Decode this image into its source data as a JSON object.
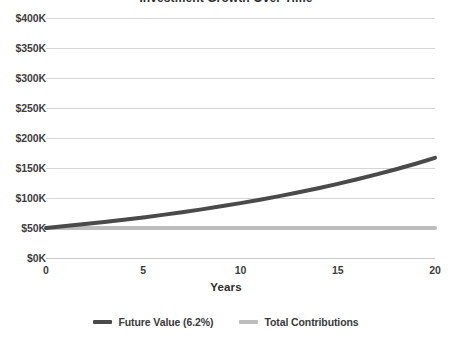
{
  "chart_title_fragment": "Investment Growth Over Time",
  "axis": {
    "x_title": "Years",
    "y_ticks": [
      "$0K",
      "$50K",
      "$100K",
      "$150K",
      "$200K",
      "$250K",
      "$300K",
      "$350K",
      "$400K"
    ],
    "x_ticks": [
      "0",
      "5",
      "10",
      "15",
      "20"
    ]
  },
  "legend": {
    "items": [
      {
        "label": "Future Value (6.2%)",
        "color": "#4a4a4a"
      },
      {
        "label": "Total Contributions",
        "color": "#bdbdbd"
      }
    ]
  },
  "colors": {
    "future_value": "#4a4a4a",
    "total_contributions": "#bdbdbd",
    "gridline": "#d5d5d5",
    "text": "#3d3d3d",
    "background": "#ffffff"
  },
  "chart_data": {
    "type": "line",
    "title": "Investment Growth Over Time",
    "xlabel": "Years",
    "ylabel": "",
    "xlim": [
      0,
      20
    ],
    "ylim": [
      0,
      400000
    ],
    "grid": true,
    "legend_position": "bottom",
    "x": [
      0,
      1,
      2,
      3,
      4,
      5,
      6,
      7,
      8,
      9,
      10,
      11,
      12,
      13,
      14,
      15,
      16,
      17,
      18,
      19,
      20
    ],
    "y_tick_values": [
      0,
      50000,
      100000,
      150000,
      200000,
      250000,
      300000,
      350000,
      400000
    ],
    "x_tick_values": [
      0,
      5,
      10,
      15,
      20
    ],
    "series": [
      {
        "name": "Future Value (6.2%)",
        "color": "#4a4a4a",
        "values": [
          50000,
          53100,
          56392,
          59888,
          63601,
          67544,
          71732,
          76179,
          80902,
          85918,
          91245,
          96902,
          102910,
          109290,
          116066,
          123262,
          130904,
          139020,
          147640,
          156794,
          166515
        ]
      },
      {
        "name": "Total Contributions",
        "color": "#bdbdbd",
        "values": [
          50000,
          50000,
          50000,
          50000,
          50000,
          50000,
          50000,
          50000,
          50000,
          50000,
          50000,
          50000,
          50000,
          50000,
          50000,
          50000,
          50000,
          50000,
          50000,
          50000,
          50000
        ]
      }
    ]
  }
}
